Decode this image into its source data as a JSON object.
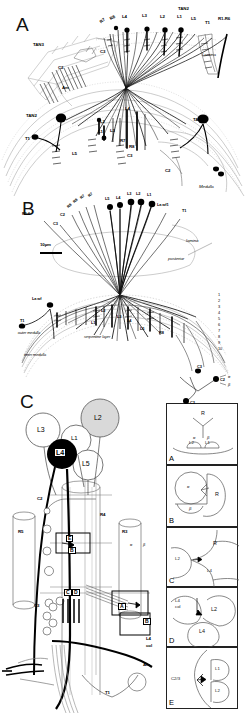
{
  "figure": {
    "caption_absent": true,
    "panels": [
      {
        "id": "A",
        "letter": "A"
      },
      {
        "id": "B",
        "letter": "B"
      },
      {
        "id": "C",
        "letter": "C"
      }
    ]
  },
  "panelA": {
    "letter": "A",
    "scale_note": "",
    "labels_top": [
      {
        "text": "R7",
        "x": 104,
        "y": 23
      },
      {
        "text": "R8",
        "x": 115,
        "y": 20
      },
      {
        "text": "L4",
        "x": 127,
        "y": 19
      },
      {
        "text": "L3",
        "x": 146,
        "y": 18
      },
      {
        "text": "L2",
        "x": 165,
        "y": 19
      },
      {
        "text": "L1",
        "x": 181,
        "y": 19
      },
      {
        "text": "L5",
        "x": 194,
        "y": 21
      },
      {
        "text": "TAN2",
        "x": 183,
        "y": 11
      },
      {
        "text": "T1",
        "x": 208,
        "y": 24
      },
      {
        "text": "R1-R6",
        "x": 221,
        "y": 21
      }
    ],
    "labels_other": [
      {
        "text": "TAN3",
        "x": 38,
        "y": 47
      },
      {
        "text": "C2",
        "x": 62,
        "y": 70
      },
      {
        "text": "C3",
        "x": 104,
        "y": 54
      },
      {
        "text": "Am",
        "x": 66,
        "y": 90
      },
      {
        "text": "Lamina",
        "x": 206,
        "y": 57
      },
      {
        "text": "TAN2",
        "x": 33,
        "y": 118
      },
      {
        "text": "T1",
        "x": 29,
        "y": 140
      },
      {
        "text": "L5",
        "x": 76,
        "y": 155
      },
      {
        "text": "L1",
        "x": 102,
        "y": 133
      },
      {
        "text": "L2",
        "x": 104,
        "y": 124
      },
      {
        "text": "L3",
        "x": 113,
        "y": 132
      },
      {
        "text": "L4",
        "x": 128,
        "y": 111
      },
      {
        "text": "R7",
        "x": 124,
        "y": 142
      },
      {
        "text": "R8",
        "x": 133,
        "y": 148
      },
      {
        "text": "C3",
        "x": 131,
        "y": 157
      },
      {
        "text": "C2",
        "x": 169,
        "y": 172
      },
      {
        "text": "TAN1",
        "x": 197,
        "y": 122
      },
      {
        "text": "Medulla",
        "x": 203,
        "y": 188
      }
    ]
  },
  "panelB": {
    "letter": "B",
    "scale_text": "10µm",
    "labels": [
      {
        "text": "R8",
        "x": 71,
        "y": 207
      },
      {
        "text": "R8",
        "x": 77,
        "y": 203
      },
      {
        "text": "R7",
        "x": 84,
        "y": 199
      },
      {
        "text": "R7",
        "x": 92,
        "y": 197
      },
      {
        "text": "L5",
        "x": 110,
        "y": 201
      },
      {
        "text": "L4",
        "x": 120,
        "y": 200
      },
      {
        "text": "L3",
        "x": 131,
        "y": 195
      },
      {
        "text": "L2",
        "x": 140,
        "y": 195
      },
      {
        "text": "L1",
        "x": 150,
        "y": 196
      },
      {
        "text": "La wf1",
        "x": 160,
        "y": 205
      },
      {
        "text": "T1",
        "x": 185,
        "y": 210
      },
      {
        "text": "R1-6",
        "x": 37,
        "y": 213
      },
      {
        "text": "C2",
        "x": 64,
        "y": 214
      },
      {
        "text": "C3",
        "x": 58,
        "y": 222
      },
      {
        "text": "lamina",
        "x": 190,
        "y": 242
      },
      {
        "text": "posterior",
        "x": 172,
        "y": 261
      },
      {
        "text": "La wf",
        "x": 38,
        "y": 300
      },
      {
        "text": "T1",
        "x": 25,
        "y": 323
      },
      {
        "text": "outer medulla",
        "x": 25,
        "y": 337
      },
      {
        "text": "inner medulla",
        "x": 30,
        "y": 357
      },
      {
        "text": "serpentine layer",
        "x": 91,
        "y": 339
      },
      {
        "text": "L1",
        "x": 94,
        "y": 325
      },
      {
        "text": "L2",
        "x": 104,
        "y": 312
      },
      {
        "text": "L3",
        "x": 120,
        "y": 318
      },
      {
        "text": "L4",
        "x": 130,
        "y": 322
      },
      {
        "text": "L5",
        "x": 143,
        "y": 330
      },
      {
        "text": "R8",
        "x": 162,
        "y": 333
      },
      {
        "text": "C3",
        "x": 200,
        "y": 368
      }
    ],
    "medulla_layer_numbers": [
      "1",
      "2",
      "3",
      "4",
      "5",
      "6",
      "7",
      "8",
      "9",
      "10"
    ]
  },
  "panelC": {
    "letter": "C",
    "somata": [
      {
        "text": "L3",
        "x": 43,
        "y": 430,
        "fill": "#ffffff"
      },
      {
        "text": "L2",
        "x": 100,
        "y": 418,
        "fill": "#d9d9d9"
      },
      {
        "text": "L1",
        "x": 76,
        "y": 440,
        "fill": "#ffffff"
      },
      {
        "text": "L4",
        "x": 62,
        "y": 454,
        "fill": "#000000"
      },
      {
        "text": "L5",
        "x": 88,
        "y": 465,
        "fill": "#ffffff"
      }
    ],
    "labels": [
      {
        "text": "C2",
        "x": 41,
        "y": 501
      },
      {
        "text": "R5",
        "x": 24,
        "y": 533
      },
      {
        "text": "R4",
        "x": 104,
        "y": 516
      },
      {
        "text": "R3",
        "x": 122,
        "y": 532
      },
      {
        "text": "C3",
        "x": 39,
        "y": 607
      },
      {
        "text": "T1",
        "x": 108,
        "y": 690
      },
      {
        "text": "Am",
        "x": 147,
        "y": 665
      },
      {
        "text": "L4",
        "x": 149,
        "y": 640
      },
      {
        "text": "col",
        "x": 149,
        "y": 646
      },
      {
        "text": "α",
        "x": 132,
        "y": 545
      },
      {
        "text": "β",
        "x": 146,
        "y": 545
      }
    ],
    "box_markers": [
      {
        "text": "E",
        "x": 70,
        "y": 540
      },
      {
        "text": "B",
        "x": 72,
        "y": 552
      },
      {
        "text": "C",
        "x": 69,
        "y": 595
      },
      {
        "text": "D",
        "x": 76,
        "y": 595
      },
      {
        "text": "A",
        "x": 122,
        "y": 598
      },
      {
        "text": "A",
        "x": 122,
        "y": 602
      },
      {
        "text": "B",
        "x": 147,
        "y": 620
      }
    ]
  },
  "insets": [
    {
      "letter": "A",
      "items": [
        {
          "text": "R",
          "x": 42,
          "y": 16
        },
        {
          "text": "L2",
          "x": 30,
          "y": 41
        },
        {
          "text": "L1",
          "x": 46,
          "y": 41
        },
        {
          "text": "α",
          "x": 33,
          "y": 36
        },
        {
          "text": "β",
          "x": 44,
          "y": 36
        }
      ]
    },
    {
      "letter": "B",
      "items": [
        {
          "text": "R",
          "x": 55,
          "y": 30
        },
        {
          "text": "α",
          "x": 24,
          "y": 21
        },
        {
          "text": "β",
          "x": 26,
          "y": 40
        }
      ]
    },
    {
      "letter": "C",
      "items": [
        {
          "text": "R",
          "x": 52,
          "y": 19
        },
        {
          "text": "L2",
          "x": 18,
          "y": 33
        },
        {
          "text": "L4",
          "x": 48,
          "y": 46
        }
      ]
    },
    {
      "letter": "D",
      "items": [
        {
          "text": "L4",
          "x": 16,
          "y": 16
        },
        {
          "text": "col",
          "x": 16,
          "y": 22
        },
        {
          "text": "L2",
          "x": 50,
          "y": 24
        },
        {
          "text": "L4",
          "x": 38,
          "y": 45
        }
      ]
    },
    {
      "letter": "E",
      "items": [
        {
          "text": "C2/3",
          "x": 12,
          "y": 30
        },
        {
          "text": "L1",
          "x": 52,
          "y": 21
        },
        {
          "text": "L2",
          "x": 52,
          "y": 38
        }
      ]
    }
  ],
  "colors": {
    "ink": "#000000",
    "light_ink": "#888888",
    "mid_gray": "#bbbbbb",
    "fill_gray": "#d9d9d9",
    "background": "#ffffff"
  }
}
